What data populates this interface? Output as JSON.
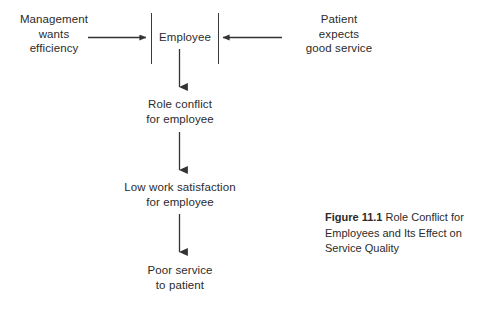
{
  "figure": {
    "caption_label": "Figure 11.1",
    "caption_text": " Role Conflict for Employees and Its Effect on Service Quality"
  },
  "diagram": {
    "sources": [
      {
        "id": "management",
        "text": "Management\nwants\nefficiency"
      },
      {
        "id": "patient",
        "text": "Patient\nexpects\ngood service"
      }
    ],
    "center_node": {
      "id": "employee",
      "text": "Employee"
    },
    "chain": [
      {
        "id": "role-conflict",
        "text": "Role conflict\nfor employee"
      },
      {
        "id": "low-satisfaction",
        "text": "Low work satisfaction\nfor employee"
      },
      {
        "id": "poor-service",
        "text": "Poor service\nto patient"
      }
    ],
    "line_color": "#333333",
    "text_color": "#2b2b2b",
    "background_color": "#ffffff"
  }
}
